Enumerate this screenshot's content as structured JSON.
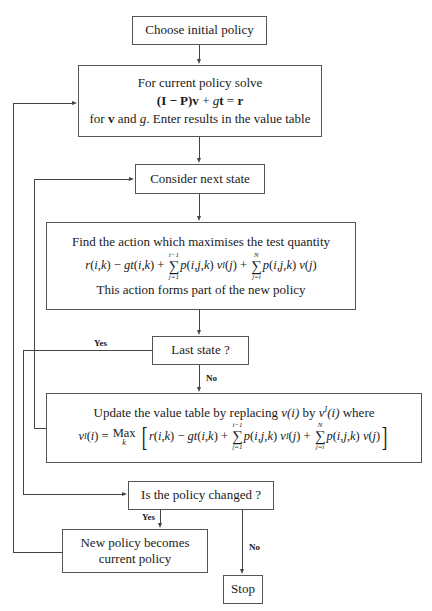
{
  "diagram": {
    "type": "flowchart",
    "nodes": {
      "start": {
        "label": "Choose initial policy"
      },
      "solve": {
        "line1": "For current policy solve",
        "equation": "(I − P)v + gt = r",
        "line3": "for v and g. Enter results in the value table"
      },
      "next_state": {
        "label": "Consider next state"
      },
      "find_action": {
        "line1": "Find the action which maximises the test quantity",
        "formula": "r(i,k) − gt(i,k) + Σ_{j=1}^{i−1} p(i,j,k) v^I(j) + Σ_{j=i}^{N} p(i,j,k) v(j)",
        "line3": "This action forms part of the new policy"
      },
      "last_state": {
        "label": "Last state ?"
      },
      "update": {
        "line1": "Update the value table by replacing v(i) by v^I(i) where",
        "formula": "v^I(i) = Max_k [ r(i,k) − gt(i,k) + Σ_{j=1}^{i−1} p(i,j,k) v^I(j) + Σ_{j=i}^{N} p(i,j,k) v(j) ]"
      },
      "policy_changed": {
        "label": "Is the policy changed ?"
      },
      "new_policy": {
        "line1": "New policy becomes",
        "line2": "current policy"
      },
      "stop": {
        "label": "Stop"
      }
    },
    "edge_labels": {
      "last_yes": "Yes",
      "last_no": "No",
      "changed_yes": "Yes",
      "changed_no": "No"
    },
    "math": {
      "r": "r",
      "i": "i",
      "k": "k",
      "g": "g",
      "t": "t",
      "p": "p",
      "j": "j",
      "v": "v",
      "I_sup": "I",
      "lim_j1": "j=1",
      "lim_ji": "j=i",
      "lim_im1": "i−1",
      "lim_N": "N",
      "max": "Max",
      "sub_k": "k",
      "eq_bold1": "(I − P)v",
      "eq_plus": " + ",
      "eq_g": "g",
      "eq_t": "t",
      "eq_eq": " = ",
      "eq_r": "r",
      "line3_a": "for ",
      "line3_v": "v",
      "line3_b": " and ",
      "line3_g": "g",
      "line3_c": ". Enter results in the value table",
      "upd_a": "Update the value table by replacing ",
      "upd_v": "v(i)",
      "upd_b": " by ",
      "upd_vI": "v",
      "upd_I": "I",
      "upd_ic": "(i)",
      "upd_c": " where"
    }
  }
}
